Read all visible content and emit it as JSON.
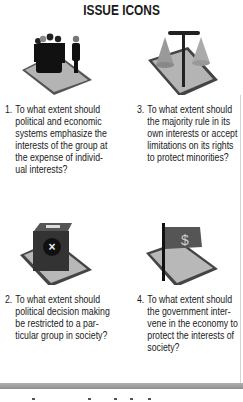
{
  "header": {
    "title": "ISSUE ICONS"
  },
  "issues": [
    {
      "number": "1.",
      "icon": "group-vs-individual-icon",
      "lines": [
        "To what extent should",
        "political and economic",
        "systems emphasize the",
        "interests of the group at",
        "the expense of individ-",
        "ual interests?"
      ]
    },
    {
      "number": "3.",
      "icon": "majority-minority-scale-icon",
      "lines": [
        "To what extent should",
        "the majority rule in its",
        "own interests or accept",
        "limitations on its rights",
        "to protect minorities?"
      ]
    },
    {
      "number": "2.",
      "icon": "ballot-box-icon",
      "lines": [
        "To what extent should",
        "political decision making",
        "be restricted to a par-",
        "ticular group in society?"
      ]
    },
    {
      "number": "4.",
      "icon": "dollar-flag-icon",
      "lines": [
        "To what extent should",
        "the government inter-",
        "vene in the economy to",
        "protect the interests of",
        "society?"
      ]
    }
  ],
  "colors": {
    "text": "#1a1a1a",
    "platform": "#a8a8a8",
    "platform_edge": "#555555",
    "bar": "#9a9a9a"
  }
}
